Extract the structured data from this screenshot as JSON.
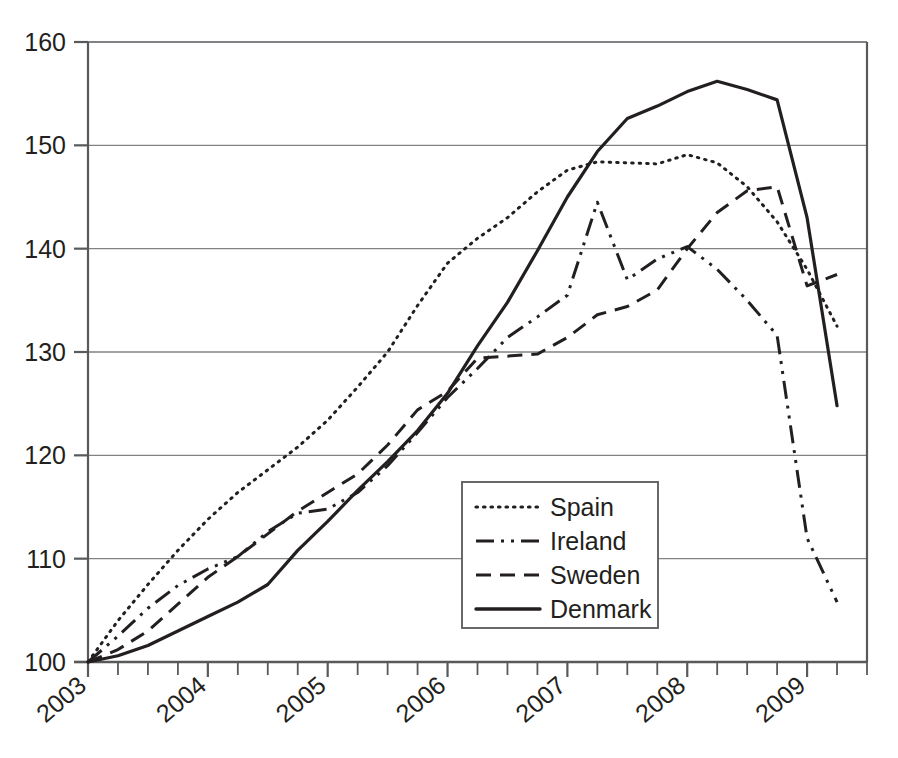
{
  "chart_data": {
    "type": "line",
    "title": "",
    "subtitle": "",
    "xlabel": "",
    "ylabel": "",
    "xlim": [
      2003.0,
      2009.5
    ],
    "ylim": [
      100,
      160
    ],
    "yticks": [
      100,
      110,
      120,
      130,
      140,
      150,
      160
    ],
    "ytick_labels": [
      "100",
      "110",
      "120",
      "130",
      "140",
      "150",
      "160"
    ],
    "xticks": [
      2003,
      2004,
      2005,
      2006,
      2007,
      2008,
      2009
    ],
    "xtick_labels": [
      "2003",
      "2004",
      "2005",
      "2006",
      "2007",
      "2008",
      "2009"
    ],
    "x_minor_tick_interval": 0.25,
    "grid": "horizontal",
    "legend_position": "center",
    "legend_entries": [
      "Spain",
      "Ireland",
      "Sweden",
      "Denmark"
    ],
    "x": [
      2003.0,
      2003.25,
      2003.5,
      2003.75,
      2004.0,
      2004.25,
      2004.5,
      2004.75,
      2005.0,
      2005.25,
      2005.5,
      2005.75,
      2006.0,
      2006.25,
      2006.5,
      2006.75,
      2007.0,
      2007.25,
      2007.5,
      2007.75,
      2008.0,
      2008.25,
      2008.5,
      2008.75,
      2009.0,
      2009.25
    ],
    "series": [
      {
        "name": "Spain",
        "style": "dotted",
        "color": "#231f20",
        "values": [
          100.0,
          104.0,
          107.5,
          110.8,
          113.8,
          116.4,
          118.6,
          120.8,
          123.4,
          126.6,
          130.0,
          134.5,
          138.6,
          141.0,
          143.0,
          145.5,
          147.6,
          148.4,
          148.3,
          148.2,
          149.1,
          148.3,
          146.0,
          142.6,
          138.0,
          132.5
        ]
      },
      {
        "name": "Ireland",
        "style": "dash-dot",
        "color": "#231f20",
        "values": [
          100.0,
          102.5,
          105.2,
          107.4,
          109.0,
          110.2,
          112.6,
          114.4,
          114.8,
          116.4,
          119.0,
          122.2,
          125.6,
          128.4,
          131.4,
          133.4,
          135.5,
          144.5,
          137.0,
          139.0,
          140.2,
          138.0,
          135.0,
          131.6,
          128.4,
          120.0
        ]
      },
      {
        "name": "Sweden",
        "style": "dashed",
        "color": "#231f20",
        "values": [
          100.0,
          101.2,
          103.0,
          105.6,
          108.2,
          110.2,
          112.4,
          114.6,
          116.4,
          118.2,
          121.0,
          124.4,
          126.2,
          129.4,
          129.6,
          129.8,
          131.4,
          133.6,
          134.4,
          136.0,
          140.0,
          143.5,
          145.6,
          146.0,
          145.4,
          142.8
        ]
      },
      {
        "name": "Denmark",
        "style": "solid",
        "color": "#231f20",
        "values": [
          100.0,
          100.6,
          101.6,
          103.0,
          104.4,
          105.8,
          107.5,
          110.8,
          113.6,
          116.6,
          119.4,
          122.4,
          126.0,
          130.6,
          134.8,
          139.8,
          145.0,
          149.4,
          152.6,
          153.8,
          155.2,
          156.2,
          155.4,
          154.4,
          155.8,
          154.6
        ]
      }
    ],
    "series_notes": [
      {
        "name": "Ireland",
        "note": "declines steeply after 2008, ending near 105.8 at 2009.25"
      },
      {
        "name": "Sweden",
        "note": "dips to 136.5 then upticks to 137.5 at series end"
      },
      {
        "name": "Denmark",
        "note": "double peak near 156.2 and 155.8, ends at 124.8"
      },
      {
        "name": "Spain",
        "note": "plateau near 148.4 through 2007, ends at 132.5"
      }
    ]
  },
  "axis": {
    "y_labels": [
      "160",
      "150",
      "140",
      "130",
      "120",
      "110",
      "100"
    ],
    "x_labels": [
      "2003",
      "2004",
      "2005",
      "2006",
      "2007",
      "2008",
      "2009"
    ]
  },
  "legend": {
    "items": [
      {
        "label": "Spain",
        "style": "dotted"
      },
      {
        "label": "Ireland",
        "style": "dash-dot"
      },
      {
        "label": "Sweden",
        "style": "dashed"
      },
      {
        "label": "Denmark",
        "style": "solid"
      }
    ]
  },
  "style": {
    "axis_color": "#58595b",
    "grid_color": "#808285",
    "line_color": "#231f20",
    "text_color": "#231f20",
    "background": "#ffffff"
  }
}
